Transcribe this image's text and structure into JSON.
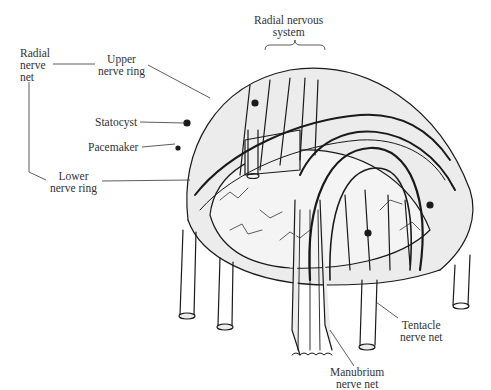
{
  "figure": {
    "labels": {
      "radial_nervous_system": "Radial nervous\nsystem",
      "radial_nerve_net": "Radial\nnerve\nnet",
      "upper_nerve_ring": "Upper\nnerve ring",
      "statocyst": "Statocyst",
      "pacemaker": "Pacemaker",
      "lower_nerve_ring": "Lower\nnerve ring",
      "tentacle_nerve_net": "Tentacle\nnerve net",
      "manubrium_nerve_net": "Manubrium\nnerve net"
    },
    "colors": {
      "line": "#1a1a1a",
      "fill": "#ececec",
      "text": "#333333",
      "background": "#ffffff"
    }
  }
}
